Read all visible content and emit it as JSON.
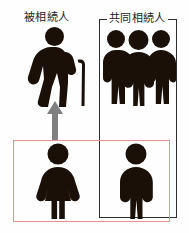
{
  "diagram": {
    "title_left": "被相続人",
    "title_right": "共同相続人",
    "background_color": "#fefefe",
    "figure_color": "#1a1008",
    "frame_color": "#2e2e2e",
    "highlight_color": "#e8918c",
    "arrow_color": "#808080"
  },
  "labels": {
    "decedent": "被相続人",
    "coheirs": "共同相続人"
  },
  "groups": {
    "coheir_bracket": {
      "label": "共同相続人",
      "member_count": 3
    },
    "highlight_box": {
      "member_count": 2
    }
  },
  "figures": {
    "decedent": "elderly-person-with-cane-icon",
    "coheirs": "three-standing-people-icon",
    "spouse": "woman-icon",
    "child": "man-icon"
  },
  "arrow": {
    "direction": "up",
    "name": "upward-arrow-icon"
  }
}
